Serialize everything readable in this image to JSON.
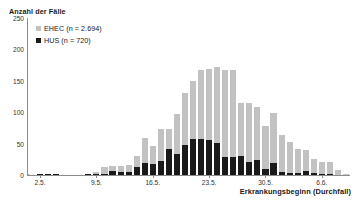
{
  "chart_data": {
    "type": "bar",
    "subtype": "stacked-bar-epidemic-curve",
    "title": "",
    "ylabel": "Anzahl der Fälle",
    "xlabel": "Erkrankungsbeginn (Durchfall)",
    "ylim": [
      0,
      250
    ],
    "yticks": [
      0,
      50,
      100,
      150,
      200,
      250
    ],
    "ytick_labels": [
      "0",
      "50",
      "100",
      "150",
      "200",
      "250"
    ],
    "grid": false,
    "legend_position": "top-left",
    "legend": [
      {
        "name": "EHEC (n = 2.694)",
        "color": "#c2c2c2"
      },
      {
        "name": "HUS (n = 720)",
        "color": "#1a1a1a"
      }
    ],
    "xtick_labels": [
      "2.5.",
      "9.5.",
      "16.5.",
      "23.5.",
      "30.5.",
      "6.6."
    ],
    "xtick_categories": [
      "2.5.",
      "9.5.",
      "16.5.",
      "23.5.",
      "30.5.",
      "6.6."
    ],
    "categories": [
      "1.5.",
      "2.5.",
      "3.5.",
      "4.5.",
      "5.5.",
      "6.5.",
      "7.5.",
      "8.5.",
      "9.5.",
      "10.5.",
      "11.5.",
      "12.5.",
      "13.5.",
      "14.5.",
      "15.5.",
      "16.5.",
      "17.5.",
      "18.5.",
      "19.5.",
      "20.5.",
      "21.5.",
      "22.5.",
      "23.5.",
      "24.5.",
      "25.5.",
      "26.5.",
      "27.5.",
      "28.5.",
      "29.5.",
      "30.5.",
      "31.5.",
      "1.6.",
      "2.6.",
      "3.6.",
      "4.6.",
      "5.6.",
      "6.6.",
      "7.6.",
      "8.6.",
      "9.6."
    ],
    "series": [
      {
        "name": "HUS (n = 720)",
        "color": "#1a1a1a",
        "values": [
          0,
          1,
          1,
          1,
          0,
          0,
          0,
          1,
          1,
          2,
          6,
          5,
          5,
          12,
          19,
          18,
          22,
          42,
          33,
          48,
          57,
          58,
          55,
          51,
          28,
          28,
          30,
          21,
          24,
          10,
          19,
          5,
          3,
          3,
          6,
          3,
          2,
          1,
          0,
          0
        ]
      },
      {
        "name": "EHEC (n = 2.694)",
        "color": "#c2c2c2",
        "values": [
          0,
          1,
          1,
          1,
          0,
          0,
          0,
          1,
          4,
          10,
          8,
          9,
          11,
          18,
          40,
          29,
          52,
          32,
          64,
          83,
          92,
          110,
          114,
          121,
          140,
          139,
          84,
          93,
          85,
          68,
          79,
          59,
          49,
          38,
          34,
          22,
          19,
          19,
          8,
          2
        ]
      }
    ],
    "totals": [
      0,
      2,
      2,
      2,
      0,
      0,
      0,
      2,
      5,
      12,
      14,
      14,
      16,
      30,
      59,
      47,
      74,
      74,
      97,
      131,
      149,
      168,
      169,
      172,
      168,
      167,
      114,
      114,
      109,
      78,
      98,
      64,
      52,
      41,
      40,
      25,
      21,
      20,
      8,
      2
    ],
    "peak_total": 205
  }
}
